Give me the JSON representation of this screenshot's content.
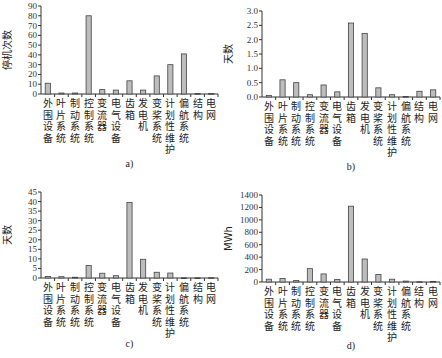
{
  "categories": [
    "外围设备",
    "叶片系统",
    "制动系统",
    "控制系统",
    "变流器",
    "电气设备",
    "齿箱",
    "发电机",
    "变桨系统",
    "计划性维护",
    "偏航系统",
    "结构",
    "电网"
  ],
  "bar_color": "#bdbdbd",
  "bar_edge_color": "#444444",
  "chart_data": [
    {
      "type": "bar",
      "panel": "a",
      "caption": "a)",
      "title": "",
      "xlabel": "",
      "ylabel": "停机次数",
      "ylim": [
        0,
        90
      ],
      "yticks": [
        0,
        10,
        20,
        30,
        40,
        50,
        60,
        70,
        80,
        90
      ],
      "ytick_labels": [
        "0",
        "10",
        "20",
        "30",
        "40",
        "50",
        "60",
        "70",
        "80",
        "90"
      ],
      "categories": [
        "外围设备",
        "叶片系统",
        "制动系统",
        "控制系统",
        "变流器",
        "电气设备",
        "齿箱",
        "发电机",
        "变桨系统",
        "计划性维护",
        "偏航系统",
        "结构",
        "电网"
      ],
      "values": [
        11,
        1,
        1,
        80,
        4.5,
        4,
        13.5,
        4,
        18.5,
        30,
        41,
        0.5,
        0.5
      ],
      "grid": false,
      "legend": null
    },
    {
      "type": "bar",
      "panel": "b",
      "caption": "b)",
      "title": "",
      "xlabel": "",
      "ylabel": "天数",
      "ylim": [
        0,
        3.0
      ],
      "yticks": [
        0,
        0.5,
        1.0,
        1.5,
        2.0,
        2.5,
        3.0
      ],
      "ytick_labels": [
        "0.0",
        "0.5",
        "1.0",
        "1.5",
        "2.0",
        "2.5",
        "3.0"
      ],
      "categories": [
        "外围设备",
        "叶片系统",
        "制动系统",
        "控制系统",
        "变流器",
        "电气设备",
        "齿箱",
        "发电机",
        "变桨系统",
        "计划性维护",
        "偏航系统",
        "结构",
        "电网"
      ],
      "values": [
        0.05,
        0.6,
        0.5,
        0.08,
        0.42,
        0.18,
        2.58,
        2.22,
        0.32,
        0.08,
        0.02,
        0.2,
        0.25
      ],
      "grid": false,
      "legend": null
    },
    {
      "type": "bar",
      "panel": "c",
      "caption": "c)",
      "title": "",
      "xlabel": "",
      "ylabel": "天数",
      "ylim": [
        0,
        45
      ],
      "yticks": [
        0,
        5,
        10,
        15,
        20,
        25,
        30,
        35,
        40,
        45
      ],
      "ytick_labels": [
        "0",
        "5",
        "10",
        "15",
        "20",
        "25",
        "30",
        "35",
        "40",
        "45"
      ],
      "categories": [
        "外围设备",
        "叶片系统",
        "制动系统",
        "控制系统",
        "变流器",
        "电气设备",
        "齿箱",
        "发电机",
        "变桨系统",
        "计划性维护",
        "偏航系统",
        "结构",
        "电网"
      ],
      "values": [
        0.8,
        0.7,
        0.4,
        6.5,
        2.5,
        1.2,
        39.5,
        9.8,
        3.0,
        2.6,
        0.1,
        0.1,
        0.2
      ],
      "grid": false,
      "legend": null
    },
    {
      "type": "bar",
      "panel": "d",
      "caption": "d)",
      "title": "",
      "xlabel": "",
      "ylabel": "MWh",
      "ylim": [
        0,
        1400
      ],
      "yticks": [
        0,
        200,
        400,
        600,
        800,
        1000,
        1200,
        1400
      ],
      "ytick_labels": [
        "0",
        "200",
        "400",
        "600",
        "800",
        "1000",
        "1200",
        "1400"
      ],
      "categories": [
        "外围设备",
        "叶片系统",
        "制动系统",
        "控制系统",
        "变流器",
        "电气设备",
        "齿箱",
        "发电机",
        "变桨系统",
        "计划性维护",
        "偏航系统",
        "结构",
        "电网"
      ],
      "values": [
        45,
        55,
        25,
        215,
        130,
        40,
        1220,
        370,
        120,
        45,
        15,
        5,
        10
      ],
      "grid": false,
      "legend": null
    }
  ],
  "layout": [
    {
      "left": 0,
      "top": 0,
      "axis_x": 41,
      "axis_right": 218,
      "y_top": 6,
      "y_zero": 94,
      "caption_y": 167
    },
    {
      "left": 0,
      "top": 0,
      "axis_x": 262,
      "axis_right": 440,
      "y_top": 11,
      "y_zero": 97,
      "caption_y": 170
    },
    {
      "left": 0,
      "top": 0,
      "axis_x": 41,
      "axis_right": 218,
      "y_top": 192,
      "y_zero": 278,
      "caption_y": 347
    },
    {
      "left": 0,
      "top": 0,
      "axis_x": 262,
      "axis_right": 440,
      "y_top": 195,
      "y_zero": 282,
      "caption_y": 349
    }
  ]
}
